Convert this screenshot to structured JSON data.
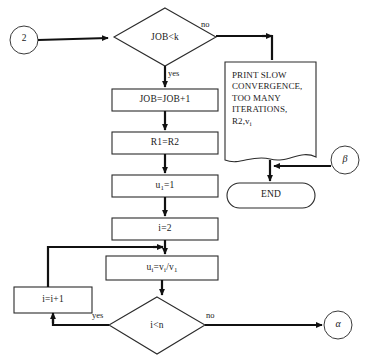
{
  "diagram": {
    "background_color": "#ffffff",
    "line_color": "#111111",
    "text_color": "#1a1a1a"
  },
  "nodes": {
    "entry_connector": {
      "label": "2",
      "shape": "circle"
    },
    "decision_job": {
      "label": "JOB<k",
      "shape": "diamond"
    },
    "process_job_increment": {
      "label": "JOB=JOB+1",
      "shape": "rectangle"
    },
    "process_r1": {
      "label": "R1=R2",
      "shape": "rectangle"
    },
    "process_u1": {
      "label_main": "u",
      "label_sub": "1",
      "label_tail": "=1",
      "shape": "rectangle"
    },
    "process_i_init": {
      "label": "i=2",
      "shape": "rectangle"
    },
    "process_ui": {
      "label_parts": [
        "u",
        "i",
        "=v",
        "i",
        "/v",
        "1"
      ],
      "shape": "rectangle"
    },
    "process_i_increment": {
      "label": "i=i+1",
      "shape": "rectangle"
    },
    "decision_i_lt_n": {
      "label": "i<n",
      "shape": "diamond"
    },
    "print_box": {
      "lines": [
        "PRINT SLOW",
        "CONVERGENCE,",
        "TOO MANY",
        "ITERATIONS,"
      ],
      "line_last_main": "R2,v",
      "line_last_sub": "i",
      "shape": "document"
    },
    "terminal_end": {
      "label": "END",
      "shape": "stadium"
    },
    "connector_beta": {
      "label": "β",
      "shape": "circle"
    },
    "connector_alpha": {
      "label": "α",
      "shape": "circle"
    }
  },
  "edge_labels": {
    "job_no": "no",
    "job_yes": "yes",
    "loop_yes": "yes",
    "loop_no": "no"
  }
}
